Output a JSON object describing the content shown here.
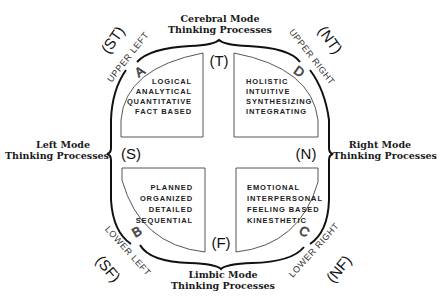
{
  "modes": {
    "top": {
      "line1": "Cerebral Mode",
      "line2": "Thinking Processes"
    },
    "left": {
      "line1": "Left Mode",
      "line2": "Thinking Processes"
    },
    "right": {
      "line1": "Right Mode",
      "line2": "Thinking Processes"
    },
    "bottom": {
      "line1": "Limbic Mode",
      "line2": "Thinking Processes"
    }
  },
  "axis_codes": {
    "top": "(T)",
    "left": "(S)",
    "right": "(N)",
    "bottom": "(F)"
  },
  "quadrants": {
    "upper_left": {
      "letter": "A",
      "corner_label": "UPPER LEFT",
      "type_code": "(ST)",
      "traits": [
        "LOGICAL",
        "ANALYTICAL",
        "QUANTITATIVE",
        "FACT BASED"
      ]
    },
    "upper_right": {
      "letter": "D",
      "corner_label": "UPPER RIGHT",
      "type_code": "(NT)",
      "traits": [
        "HOLISTIC",
        "INTUITIVE",
        "SYNTHESIZING",
        "INTEGRATING"
      ]
    },
    "lower_left": {
      "letter": "B",
      "corner_label": "LOWER LEFT",
      "type_code": "(SF)",
      "traits": [
        "PLANNED",
        "ORGANIZED",
        "DETAILED",
        "SEQUENTIAL"
      ]
    },
    "lower_right": {
      "letter": "C",
      "corner_label": "LOWER RIGHT",
      "type_code": "(NF)",
      "traits": [
        "EMOTIONAL",
        "INTERPERSONAL",
        "FEELING BASED",
        "KINESTHETIC"
      ]
    }
  },
  "colors": {
    "ink": "#1a1a1a",
    "background": "#ffffff"
  }
}
